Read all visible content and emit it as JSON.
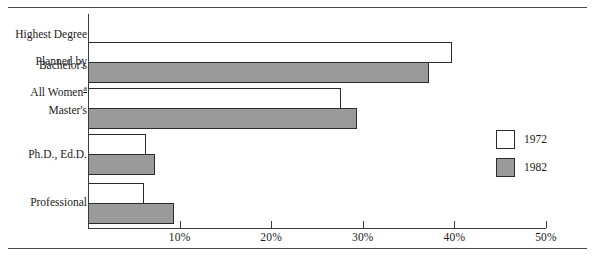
{
  "chart_data": {
    "type": "bar",
    "orientation": "horizontal",
    "title": "",
    "xlabel": "",
    "ylabel": "Highest Degree Planned by All Women",
    "ylabel_footnote": "a",
    "categories": [
      "Bachelor's",
      "Master's",
      "Ph.D., Ed.D.",
      "Professional"
    ],
    "series": [
      {
        "name": "1972",
        "color": "#ffffff",
        "values": [
          39.7,
          27.6,
          6.3,
          6.1
        ]
      },
      {
        "name": "1982",
        "color": "#9a9a9a",
        "values": [
          37.2,
          29.4,
          7.3,
          9.4
        ]
      }
    ],
    "xlim": [
      0,
      50
    ],
    "xticks": [
      0,
      10,
      20,
      30,
      40,
      50
    ],
    "xtick_labels": [
      "",
      "10%",
      "20%",
      "30%",
      "40%",
      "50%"
    ],
    "grid": false,
    "legend_position": "right"
  },
  "axis": {
    "ticks": [
      {
        "value": 0,
        "label": ""
      },
      {
        "value": 10,
        "label": "10%"
      },
      {
        "value": 20,
        "label": "20%"
      },
      {
        "value": 30,
        "label": "30%"
      },
      {
        "value": 40,
        "label": "40%"
      },
      {
        "value": 50,
        "label": "50%"
      }
    ]
  },
  "y_axis_title": {
    "line1": "Highest Degree",
    "line2": "Planned by",
    "line3": "All Women",
    "footnote": "a"
  },
  "categories": [
    {
      "label": "Bachelor's"
    },
    {
      "label": "Master's"
    },
    {
      "label": "Ph.D., Ed.D."
    },
    {
      "label": "Professional"
    }
  ],
  "legend": {
    "items": [
      {
        "label": "1972",
        "color": "#ffffff"
      },
      {
        "label": "1982",
        "color": "#9a9a9a"
      }
    ]
  }
}
